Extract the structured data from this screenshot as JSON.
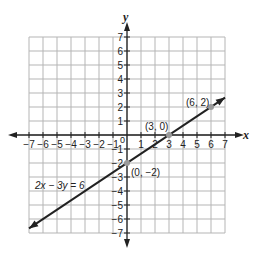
{
  "chart_data": {
    "type": "line",
    "title": "",
    "xlabel": "x",
    "ylabel": "y",
    "xlim": [
      -7,
      7
    ],
    "ylim": [
      -7,
      7
    ],
    "grid": true,
    "x_ticks": [
      -7,
      -6,
      -5,
      -4,
      -3,
      -2,
      -1,
      1,
      2,
      3,
      4,
      5,
      6,
      7
    ],
    "y_ticks": [
      7,
      6,
      5,
      4,
      3,
      2,
      1,
      -1,
      -2,
      -3,
      -4,
      -5,
      -6,
      -7
    ],
    "origin_label": "0",
    "series": [
      {
        "name": "2x − 3y = 6",
        "equation": "2x − 3y = 6",
        "slope": 0.6667,
        "intercept": -2,
        "x": [
          -7,
          7
        ],
        "y": [
          -6.67,
          2.67
        ],
        "arrows": "both"
      }
    ],
    "points": [
      {
        "x": 6,
        "y": 2,
        "label": "(6, 2)"
      },
      {
        "x": 3,
        "y": 0,
        "label": "(3, 0)"
      },
      {
        "x": 0,
        "y": -2,
        "label": "(0, −2)"
      }
    ],
    "annotations": [
      {
        "text": "2x − 3y = 6",
        "x": -4.5,
        "y": -3.5
      }
    ]
  },
  "labels": {
    "x_axis": "x",
    "y_axis": "y",
    "equation": "2x − 3y = 6",
    "p1": "(6, 2)",
    "p2": "(3, 0)",
    "p3": "(0, −2)",
    "origin": "0"
  }
}
